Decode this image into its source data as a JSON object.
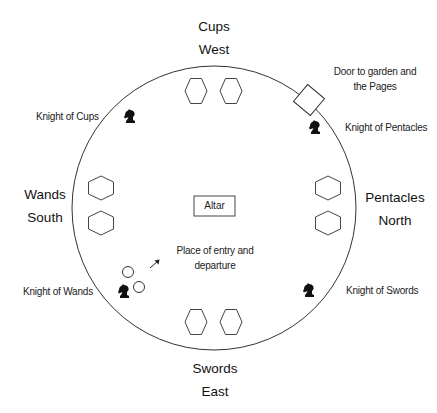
{
  "diagram": {
    "title": "",
    "colors": {
      "stroke": "#333333",
      "knight": "#111111",
      "text": "#1a1a1a",
      "background": "#ffffff"
    },
    "circle": {
      "cx": 214,
      "cy": 208,
      "r": 142
    },
    "quarters": {
      "top": {
        "suit": "Cups",
        "direction": "West"
      },
      "left": {
        "suit": "Wands",
        "direction": "South"
      },
      "right": {
        "suit": "Pentacles",
        "direction": "North"
      },
      "bottom": {
        "suit": "Swords",
        "direction": "East"
      }
    },
    "knights": {
      "cups": {
        "label": "Knight of Cups",
        "icon": "chess-knight-icon"
      },
      "pentacles": {
        "label": "Knight of Pentacles",
        "icon": "chess-knight-icon"
      },
      "wands": {
        "label": "Knight of Wands",
        "icon": "chess-knight-icon"
      },
      "swords": {
        "label": "Knight of Swords",
        "icon": "chess-knight-icon"
      }
    },
    "door": {
      "line1": "Door to garden and",
      "line2": "the Pages",
      "icon": "door-square"
    },
    "altar": {
      "label": "Altar"
    },
    "entry": {
      "line1": "Place of entry and",
      "line2": "departure",
      "icon": "arrow-up-right-icon"
    },
    "seats": {
      "top_count": 2,
      "left_count": 2,
      "right_count": 2,
      "bottom_count": 2,
      "shape": "hexagon"
    },
    "markers": {
      "entry_circles_count": 2,
      "shape": "small-circle"
    }
  }
}
